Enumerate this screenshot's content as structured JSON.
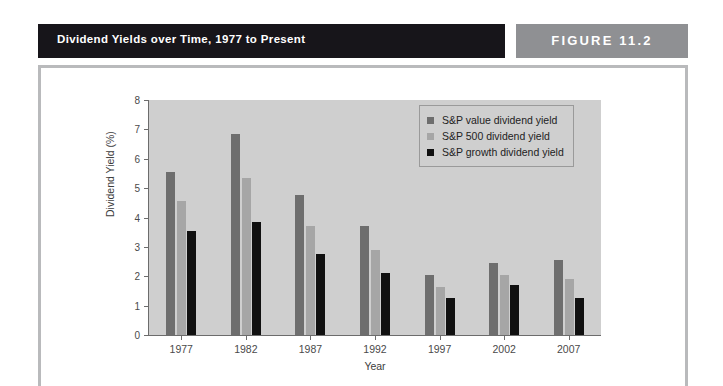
{
  "header": {
    "title": "Dividend Yields over Time, 1977 to Present",
    "figure_label": "FIGURE 11.2"
  },
  "colors": {
    "title_bar": "#17151a",
    "figure_tab": "#8f9093",
    "frame_border": "#b9babc",
    "plot_background": "#cfcfcf",
    "series_value": "#6e6e6e",
    "series_500": "#a6a6a6",
    "series_growth": "#101010"
  },
  "chart_data": {
    "type": "bar",
    "title": "Dividend Yields over Time, 1977 to Present",
    "xlabel": "Year",
    "ylabel": "Dividend Yield (%)",
    "categories": [
      "1977",
      "1982",
      "1987",
      "1992",
      "1997",
      "2002",
      "2007"
    ],
    "ylim": [
      0,
      8
    ],
    "yticks": [
      0,
      1,
      2,
      3,
      4,
      5,
      6,
      7,
      8
    ],
    "grid": false,
    "legend_position": "top-right",
    "series": [
      {
        "name": "S&P value dividend yield",
        "color": "#6e6e6e",
        "values": [
          5.55,
          6.85,
          4.75,
          3.7,
          2.05,
          2.45,
          2.55
        ]
      },
      {
        "name": "S&P 500 dividend yield",
        "color": "#a6a6a6",
        "values": [
          4.55,
          5.35,
          3.7,
          2.9,
          1.65,
          2.05,
          1.9
        ]
      },
      {
        "name": "S&P growth dividend yield",
        "color": "#101010",
        "values": [
          3.55,
          3.85,
          2.75,
          2.1,
          1.25,
          1.7,
          1.25
        ]
      }
    ]
  }
}
